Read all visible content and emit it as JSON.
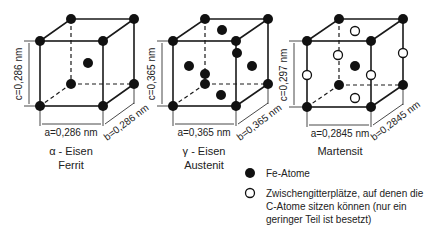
{
  "cubes": [
    {
      "id": "ferrit",
      "lattice": "bcc",
      "a_label": "a=0,286 nm",
      "b_label": "b=0,286 nm",
      "c_label": "c=0,286 nm",
      "title_line1": "α - Eisen",
      "title_line2": "Ferrit"
    },
    {
      "id": "austenit",
      "lattice": "fcc",
      "a_label": "a=0,365 nm",
      "b_label": "b=0,365 nm",
      "c_label": "c=0,365 nm",
      "title_line1": "γ - Eisen",
      "title_line2": "Austenit"
    },
    {
      "id": "martensit",
      "lattice": "bct",
      "a_label": "a=0,2845 nm",
      "b_label": "b=0,2845 nm",
      "c_label": "c=0,297 nm",
      "title_line1": "Martensit",
      "title_line2": ""
    }
  ],
  "legend": {
    "fe_atoms": "Fe-Atome",
    "interstitial_line1": "Zwischengitterplätze, auf denen die",
    "interstitial_line2": "C-Atome sitzen können (nur ein",
    "interstitial_line3": "geringer Teil ist besetzt)"
  }
}
